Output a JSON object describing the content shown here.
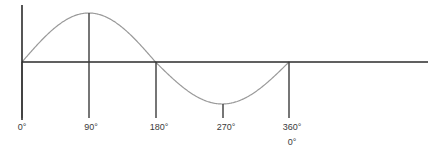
{
  "figure": {
    "name": "sine-wave-degrees-diagram",
    "width": 445,
    "height": 165,
    "background_color": "#ffffff"
  },
  "colors": {
    "axis": "#2b2b2b",
    "curve": "#9a9a9a",
    "tick_line": "#3c3c3c",
    "label_text": "#3a3a3a"
  },
  "axes": {
    "vertical_axis": {
      "x": 22,
      "y_top": 5,
      "y_bottom": 120
    },
    "horizontal_axis": {
      "y": 62,
      "x_left": 22,
      "x_right": 428
    }
  },
  "ticks": [
    {
      "label": "0°",
      "degrees": 0,
      "x": 22,
      "line_top": 62,
      "line_bottom": 118,
      "label_x": 22,
      "label_y": 122
    },
    {
      "label": "90°",
      "degrees": 90,
      "x": 89,
      "line_top": 13,
      "line_bottom": 118,
      "label_x": 91,
      "label_y": 122
    },
    {
      "label": "180°",
      "degrees": 180,
      "x": 156,
      "line_top": 62,
      "line_bottom": 118,
      "label_x": 159,
      "label_y": 122
    },
    {
      "label": "270°",
      "degrees": 270,
      "x": 223,
      "line_top": 104,
      "line_bottom": 118,
      "label_x": 226,
      "label_y": 122
    },
    {
      "label": "360°",
      "degrees": 360,
      "x": 289,
      "line_top": 62,
      "line_bottom": 118,
      "label_x": 292,
      "label_y": 122
    }
  ],
  "secondary_label": {
    "label": "0°",
    "label_x": 292,
    "label_y": 137
  },
  "chart_data": {
    "type": "line",
    "title": "",
    "subtitle": "",
    "xlabel": "",
    "ylabel": "",
    "function": "y = sin(x)",
    "xlim": [
      0,
      360
    ],
    "ylim": [
      -1,
      1
    ],
    "grid": false,
    "legend": null,
    "x_tick_labels": [
      "0°",
      "90°",
      "180°",
      "270°",
      "360°"
    ],
    "x_tick_values": [
      0,
      90,
      180,
      270,
      360
    ],
    "y_tick_labels": [],
    "annotations": [
      {
        "text": "0°",
        "at_x": 360,
        "note": "second cycle start repeated under 360°"
      }
    ],
    "series": [
      {
        "name": "sin",
        "color": "#9a9a9a",
        "x": [
          0,
          15,
          30,
          45,
          60,
          75,
          90,
          105,
          120,
          135,
          150,
          165,
          180,
          195,
          210,
          225,
          240,
          255,
          270,
          285,
          300,
          315,
          330,
          345,
          360
        ],
        "values": [
          0,
          0.259,
          0.5,
          0.707,
          0.866,
          0.966,
          1,
          0.966,
          0.866,
          0.707,
          0.5,
          0.259,
          0,
          -0.259,
          -0.5,
          -0.707,
          -0.866,
          -0.966,
          -1,
          -0.966,
          -0.866,
          -0.707,
          -0.5,
          -0.259,
          0
        ]
      }
    ],
    "key_points": [
      {
        "label": "zero crossing",
        "x": 0,
        "y": 0
      },
      {
        "label": "maximum",
        "x": 90,
        "y": 1
      },
      {
        "label": "zero crossing",
        "x": 180,
        "y": 0
      },
      {
        "label": "minimum",
        "x": 270,
        "y": -1
      },
      {
        "label": "zero crossing",
        "x": 360,
        "y": 0
      }
    ]
  }
}
